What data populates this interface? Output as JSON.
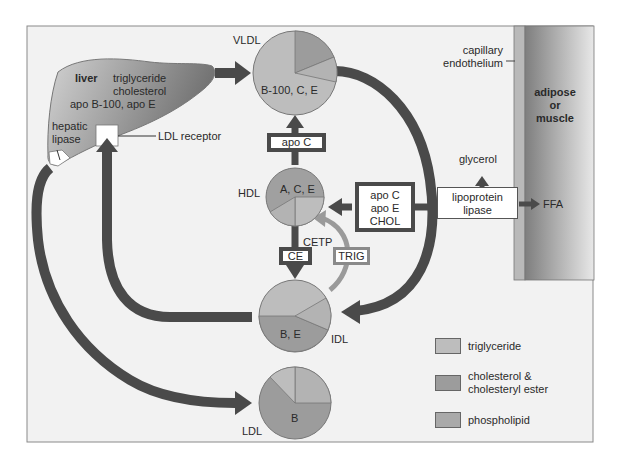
{
  "colors": {
    "panel_bg": "#f2f2f2",
    "panel_border": "#888888",
    "arrow": "#4a4a4a",
    "light_arrow": "#9a9a9a",
    "triglyceride": "#bdbdbd",
    "cholesterol": "#9c9c9c",
    "phospholipid": "#a9a9a9",
    "liver_light": "#cfcfcf",
    "liver_dark": "#7a7a7a",
    "tissue_light": "#8a8a8a",
    "tissue_dark": "#e6e6e6",
    "endothelium": "#b8b8b8"
  },
  "liver": {
    "name": "liver",
    "contents_line1": "triglyceride",
    "contents_line2": "cholesterol",
    "contents_line3": "apo B-100, apo E",
    "hepatic_lipase_line1": "hepatic",
    "hepatic_lipase_line2": "lipase",
    "ldl_receptor": "LDL receptor"
  },
  "tissue": {
    "endothelium_line1": "capillary",
    "endothelium_line2": "endothelium",
    "tissue_line1": "adipose",
    "tissue_line2": "or",
    "tissue_line3": "muscle"
  },
  "lipoproteins": {
    "vldl": {
      "label": "VLDL",
      "apos": "B-100, C, E"
    },
    "hdl": {
      "label": "HDL",
      "apos": "A, C, E"
    },
    "idl": {
      "label": "IDL",
      "apos": "B, E"
    },
    "ldl": {
      "label": "LDL",
      "apos": "B"
    }
  },
  "boxes": {
    "apo_c": "apo C",
    "transfer_line1": "apo C",
    "transfer_line2": "apo E",
    "transfer_line3": "CHOL",
    "ce": "CE",
    "trig": "TRIG",
    "cetp": "CETP",
    "lpl_line1": "lipoprotein",
    "lpl_line2": "lipase",
    "glycerol": "glycerol",
    "ffa": "FFA"
  },
  "legend": {
    "items": [
      {
        "label_line1": "triglyceride",
        "label_line2": ""
      },
      {
        "label_line1": "cholesterol &",
        "label_line2": "cholesteryl ester"
      },
      {
        "label_line1": "phospholipid",
        "label_line2": ""
      }
    ]
  }
}
